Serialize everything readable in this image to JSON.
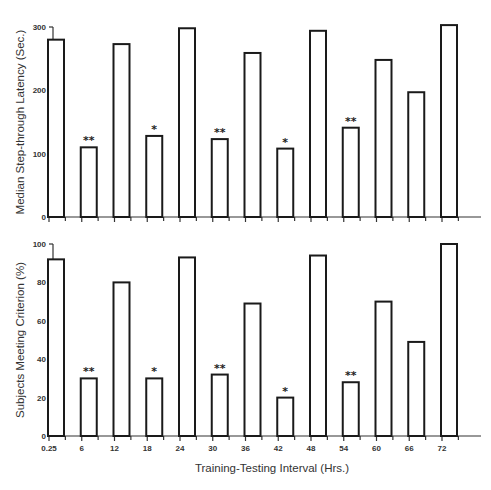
{
  "chart_data": [
    {
      "type": "bar",
      "panel": "top",
      "title": "",
      "xlabel": "",
      "ylabel": "Median Step-through Latency (Sec.)",
      "ylim": [
        0,
        300
      ],
      "yticks": [
        0,
        50,
        100,
        150,
        200,
        250,
        300
      ],
      "ytick_labels": [
        "0",
        "",
        "100",
        "",
        "200",
        "",
        "300"
      ],
      "grid": false,
      "categories": [
        "0.25",
        "6",
        "12",
        "18",
        "24",
        "30",
        "36",
        "42",
        "48",
        "54",
        "60",
        "66",
        "72"
      ],
      "values": [
        280,
        110,
        273,
        128,
        298,
        123,
        259,
        108,
        294,
        141,
        248,
        197,
        303
      ],
      "annotations": [
        "",
        "**",
        "",
        "*",
        "",
        "**",
        "",
        "*",
        "",
        "**",
        "",
        "",
        ""
      ]
    },
    {
      "type": "bar",
      "panel": "bottom",
      "title": "",
      "xlabel": "Training-Testing Interval (Hrs.)",
      "ylabel": "Subjects Meeting Criterion (%)",
      "ylim": [
        0,
        100
      ],
      "yticks": [
        0,
        20,
        40,
        60,
        80,
        100
      ],
      "ytick_labels": [
        "0",
        "20",
        "40",
        "60",
        "80",
        "100"
      ],
      "grid": false,
      "categories": [
        "0.25",
        "6",
        "12",
        "18",
        "24",
        "30",
        "36",
        "42",
        "48",
        "54",
        "60",
        "66",
        "72"
      ],
      "xtick_labels": [
        "0.25",
        "6",
        "12",
        "18",
        "24",
        "30",
        "36",
        "42",
        "48",
        "54",
        "60",
        "66",
        "72"
      ],
      "values": [
        92,
        30,
        80,
        30,
        93,
        32,
        69,
        20,
        94,
        28,
        70,
        49,
        100
      ],
      "annotations": [
        "",
        "**",
        "",
        "*",
        "",
        "**",
        "",
        "*",
        "",
        "**",
        "",
        "",
        ""
      ]
    }
  ],
  "labels": {
    "top_ylabel": "Median Step-through Latency (Sec.)",
    "bottom_ylabel": "Subjects Meeting Criterion (%)",
    "xlabel": "Training-Testing Interval (Hrs.)"
  }
}
